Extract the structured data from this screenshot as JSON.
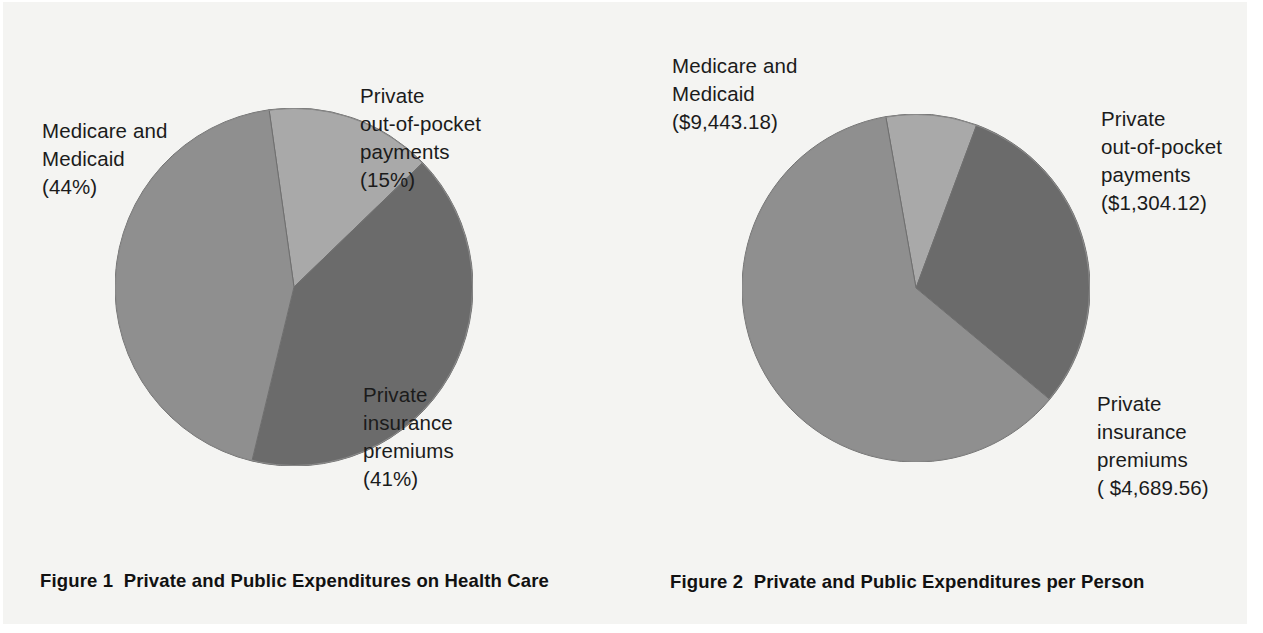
{
  "page": {
    "background_color": "#f4f4f2",
    "paper_color": "#ffffff",
    "text_color": "#1b1b1b"
  },
  "palette": {
    "medium_gray": "#8f8f8f",
    "light_gray": "#a9a9a9",
    "dark_gray": "#6b6b6b",
    "slice_outline": "#6f6f6f"
  },
  "figures": [
    {
      "id": "figure-1",
      "caption_number": "Figure 1",
      "caption_text": "Private and Public Expenditures on Health Care",
      "caption_full": "Figure 1  Private and Public Expenditures on Health Care",
      "labels": {
        "medicare": "Medicare and\nMedicaid\n(44%)",
        "out_of_pocket": "Private\nout-of-pocket\npayments\n(15%)",
        "insurance": "Private\ninsurance\npremiums\n(41%)"
      }
    },
    {
      "id": "figure-2",
      "caption_number": "Figure 2",
      "caption_text": "Private and Public Expenditures per Person",
      "caption_full": "Figure 2  Private and Public Expenditures per Person",
      "labels": {
        "medicare": "Medicare and\nMedicaid\n($9,443.18)",
        "out_of_pocket": "Private\nout-of-pocket\npayments\n($1,304.12)",
        "insurance": "Private\ninsurance\npremiums\n( $4,689.56)"
      }
    }
  ],
  "chart_data": [
    {
      "type": "pie",
      "title": "Figure 1  Private and Public Expenditures on Health Care",
      "unit": "percent",
      "categories": [
        "Medicare and Medicaid",
        "Private out-of-pocket payments",
        "Private insurance premiums"
      ],
      "values": [
        44,
        15,
        41
      ],
      "value_labels": [
        "(44%)",
        "(15%)",
        "(41%)"
      ],
      "colors": [
        "#8f8f8f",
        "#a9a9a9",
        "#6b6b6b"
      ],
      "legend": "outside labels",
      "grid": false,
      "start_angle_deg": -8,
      "direction": "clockwise"
    },
    {
      "type": "pie",
      "title": "Figure 2  Private and Public Expenditures per Person",
      "unit": "dollars per person",
      "categories": [
        "Medicare and Medicaid",
        "Private out-of-pocket payments",
        "Private insurance premiums"
      ],
      "values": [
        9443.18,
        1304.12,
        4689.56
      ],
      "value_labels": [
        "($9,443.18)",
        "($1,304.12)",
        "( $4,689.56)"
      ],
      "colors": [
        "#8f8f8f",
        "#a9a9a9",
        "#6b6b6b"
      ],
      "legend": "outside labels",
      "grid": false,
      "start_angle_deg": -10,
      "direction": "clockwise"
    }
  ]
}
